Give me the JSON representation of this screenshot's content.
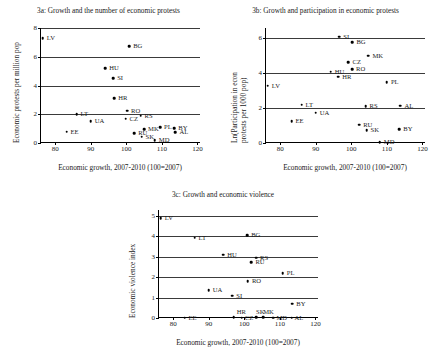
{
  "figure": {
    "xlabel": "Economic growth, 2007-2010 (100=2007)",
    "xticks": [
      "80",
      "90",
      "100",
      "110",
      "120"
    ],
    "xlim": [
      76,
      121
    ]
  },
  "chart_data": [
    {
      "type": "scatter",
      "id": "3a",
      "title": "3a: Growth and the number of economic protests",
      "xlabel": "Economic growth, 2007-2010 (100=2007)",
      "ylabel": "Economic protests per million pop",
      "xlim": [
        76,
        121
      ],
      "ylim": [
        0,
        8
      ],
      "xticks": [
        80,
        90,
        100,
        110,
        120
      ],
      "yticks": [
        0,
        2,
        4,
        6,
        8
      ],
      "grid": true,
      "points": [
        {
          "label": "LV",
          "x": 76.5,
          "y": 7.3,
          "lx": 4,
          "ly": 0
        },
        {
          "label": "BG",
          "x": 100.8,
          "y": 6.75,
          "lx": 4,
          "ly": 0
        },
        {
          "label": "HU",
          "x": 94.1,
          "y": 5.2,
          "lx": 4,
          "ly": 0
        },
        {
          "label": "SI",
          "x": 96.3,
          "y": 4.5,
          "lx": 4,
          "ly": 0
        },
        {
          "label": "HR",
          "x": 96.6,
          "y": 3.1,
          "lx": 4,
          "ly": 0
        },
        {
          "label": "RO",
          "x": 100.2,
          "y": 2.25,
          "lx": 4,
          "ly": 0
        },
        {
          "label": "RS",
          "x": 104.0,
          "y": 1.9,
          "lx": 4,
          "ly": 0
        },
        {
          "label": "LT",
          "x": 86.0,
          "y": 2.0,
          "lx": 4,
          "ly": 0
        },
        {
          "label": "CZ",
          "x": 99.8,
          "y": 1.7,
          "lx": 4,
          "ly": 0
        },
        {
          "label": "UA",
          "x": 90.0,
          "y": 1.5,
          "lx": 4,
          "ly": 0
        },
        {
          "label": "MK",
          "x": 105.0,
          "y": 0.95,
          "lx": 4,
          "ly": 0
        },
        {
          "label": "PL",
          "x": 109.5,
          "y": 1.1,
          "lx": 4,
          "ly": 0
        },
        {
          "label": "BY",
          "x": 113.5,
          "y": 1.05,
          "lx": 4,
          "ly": 0
        },
        {
          "label": "AL",
          "x": 113.8,
          "y": 0.75,
          "lx": 4,
          "ly": 0
        },
        {
          "label": "EE",
          "x": 83.2,
          "y": 0.8,
          "lx": 4,
          "ly": 0
        },
        {
          "label": "RU",
          "x": 102.2,
          "y": 0.7,
          "lx": 4,
          "ly": 0
        },
        {
          "label": "SK",
          "x": 104.3,
          "y": 0.45,
          "lx": 4,
          "ly": 0
        },
        {
          "label": "MD",
          "x": 108.0,
          "y": 0.2,
          "lx": 4,
          "ly": 0
        }
      ]
    },
    {
      "type": "scatter",
      "id": "3b",
      "title": "3b: Growth and participation in economic protests",
      "xlabel": "Economic growth, 2007-2010 (100=2007)",
      "ylabel": "Ln(Participation in econ protests per 1000 pop)",
      "xlim": [
        76,
        121
      ],
      "ylim": [
        0,
        6.6
      ],
      "xticks": [
        80,
        90,
        100,
        110,
        120
      ],
      "yticks": [
        0,
        2,
        4,
        6
      ],
      "grid": true,
      "points": [
        {
          "label": "SI",
          "x": 96.6,
          "y": 6.1,
          "lx": 4,
          "ly": 0
        },
        {
          "label": "BG",
          "x": 100.3,
          "y": 5.8,
          "lx": 4,
          "ly": 0
        },
        {
          "label": "MK",
          "x": 104.8,
          "y": 5.0,
          "lx": 4,
          "ly": 0
        },
        {
          "label": "CZ",
          "x": 99.2,
          "y": 4.65,
          "lx": 4,
          "ly": 0
        },
        {
          "label": "RO",
          "x": 100.2,
          "y": 4.25,
          "lx": 4,
          "ly": 0
        },
        {
          "label": "HU",
          "x": 94.2,
          "y": 4.1,
          "lx": 4,
          "ly": 0
        },
        {
          "label": "HR",
          "x": 96.3,
          "y": 3.8,
          "lx": 4,
          "ly": 0
        },
        {
          "label": "PL",
          "x": 110.0,
          "y": 3.5,
          "lx": 4,
          "ly": 0
        },
        {
          "label": "LV",
          "x": 76.5,
          "y": 3.3,
          "lx": 4,
          "ly": 0
        },
        {
          "label": "LT",
          "x": 86.0,
          "y": 2.2,
          "lx": 4,
          "ly": 0
        },
        {
          "label": "RS",
          "x": 104.0,
          "y": 2.1,
          "lx": 4,
          "ly": 0
        },
        {
          "label": "AL",
          "x": 113.8,
          "y": 2.15,
          "lx": 4,
          "ly": 0
        },
        {
          "label": "UA",
          "x": 90.0,
          "y": 1.75,
          "lx": 4,
          "ly": 0
        },
        {
          "label": "EE",
          "x": 83.2,
          "y": 1.25,
          "lx": 4,
          "ly": 0
        },
        {
          "label": "RU",
          "x": 102.2,
          "y": 1.05,
          "lx": 4,
          "ly": 0
        },
        {
          "label": "SK",
          "x": 104.3,
          "y": 0.75,
          "lx": 4,
          "ly": 0
        },
        {
          "label": "BY",
          "x": 113.5,
          "y": 0.8,
          "lx": 4,
          "ly": 0
        },
        {
          "label": "MD",
          "x": 108.0,
          "y": 0.05,
          "lx": 4,
          "ly": 0
        }
      ]
    },
    {
      "type": "scatter",
      "id": "3c",
      "title": "3c: Growth and economic violence",
      "xlabel": "Economic growth, 2007-2010 (100=2007)",
      "ylabel": "Economic violence index",
      "xlim": [
        76,
        121
      ],
      "ylim": [
        0,
        5.3
      ],
      "xticks": [
        80,
        90,
        100,
        110,
        120
      ],
      "yticks": [
        0,
        1,
        2,
        3,
        4,
        5
      ],
      "grid": true,
      "points": [
        {
          "label": "LV",
          "x": 76.5,
          "y": 4.9,
          "lx": 4,
          "ly": 0
        },
        {
          "label": "LT",
          "x": 86.0,
          "y": 3.95,
          "lx": 4,
          "ly": 0
        },
        {
          "label": "BG",
          "x": 100.8,
          "y": 4.05,
          "lx": 4,
          "ly": 0
        },
        {
          "label": "HU",
          "x": 94.1,
          "y": 3.1,
          "lx": 4,
          "ly": 0
        },
        {
          "label": "RS",
          "x": 103.3,
          "y": 2.95,
          "lx": 4,
          "ly": 0
        },
        {
          "label": "RU",
          "x": 102.0,
          "y": 2.75,
          "lx": 4,
          "ly": 0
        },
        {
          "label": "PL",
          "x": 110.8,
          "y": 2.2,
          "lx": 4,
          "ly": 0
        },
        {
          "label": "RO",
          "x": 101.0,
          "y": 1.8,
          "lx": 4,
          "ly": 0
        },
        {
          "label": "UA",
          "x": 90.0,
          "y": 1.35,
          "lx": 4,
          "ly": 0
        },
        {
          "label": "SI",
          "x": 96.6,
          "y": 1.1,
          "lx": 4,
          "ly": 0
        },
        {
          "label": "BY",
          "x": 113.5,
          "y": 0.7,
          "lx": 4,
          "ly": 0
        },
        {
          "label": "EE",
          "x": 83.2,
          "y": 0.02,
          "lx": 4,
          "ly": 0
        },
        {
          "label": "HR",
          "x": 97.0,
          "y": 0.05,
          "lx": 3,
          "ly": -5
        },
        {
          "label": "CZ",
          "x": 99.3,
          "y": 0.02,
          "lx": 3,
          "ly": 0
        },
        {
          "label": "SK",
          "x": 103.3,
          "y": 0.05,
          "lx": 0,
          "ly": -5
        },
        {
          "label": "MK",
          "x": 105.3,
          "y": 0.05,
          "lx": 0,
          "ly": -5
        },
        {
          "label": "MD",
          "x": 108.2,
          "y": 0.02,
          "lx": 3,
          "ly": 0
        },
        {
          "label": "AL",
          "x": 113.3,
          "y": 0.02,
          "lx": 3,
          "ly": 0
        }
      ]
    }
  ]
}
